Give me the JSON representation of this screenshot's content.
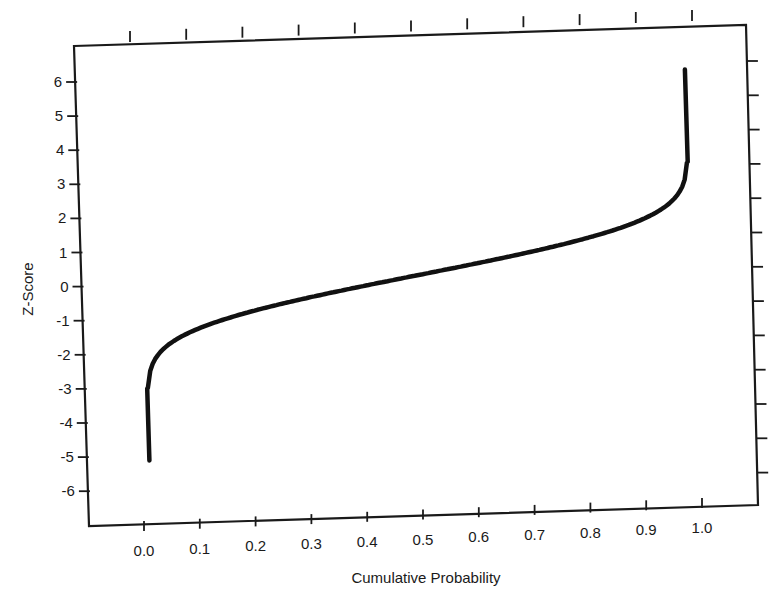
{
  "chart_data": {
    "type": "line",
    "title": "",
    "xlabel": "Cumulative Probability",
    "ylabel": "Z-Score",
    "xlim": [
      -0.05,
      1.05
    ],
    "ylim": [
      -6.5,
      7
    ],
    "grid": false,
    "legend": null,
    "x_ticks": [
      "0.0",
      "0.1",
      "0.2",
      "0.3",
      "0.4",
      "0.5",
      "0.6",
      "0.7",
      "0.8",
      "0.9",
      "1.0"
    ],
    "y_ticks": [
      "6",
      "5",
      "4",
      "3",
      "2",
      "1",
      "0",
      "-1",
      "-2",
      "-3",
      "-4",
      "-5",
      "-6"
    ],
    "series": [
      {
        "name": "Normal quantile (inverse CDF)",
        "color": "#111111",
        "x": [
          0.0,
          0.001,
          0.005,
          0.01,
          0.02,
          0.05,
          0.1,
          0.15,
          0.2,
          0.3,
          0.4,
          0.5,
          0.6,
          0.7,
          0.8,
          0.85,
          0.9,
          0.95,
          0.97,
          0.98,
          0.98
        ],
        "y": [
          -5.1,
          -3.1,
          -2.58,
          -2.33,
          -2.05,
          -1.64,
          -1.28,
          -1.04,
          -0.84,
          -0.52,
          -0.25,
          0.0,
          0.25,
          0.52,
          0.84,
          1.04,
          1.28,
          1.64,
          2.2,
          3.0,
          5.7
        ]
      }
    ]
  },
  "frame": {
    "top_left": [
      74,
      46
    ],
    "top_right": [
      746,
      25
    ],
    "bottom_left": [
      89,
      526
    ],
    "bottom_right": [
      758,
      505
    ]
  }
}
